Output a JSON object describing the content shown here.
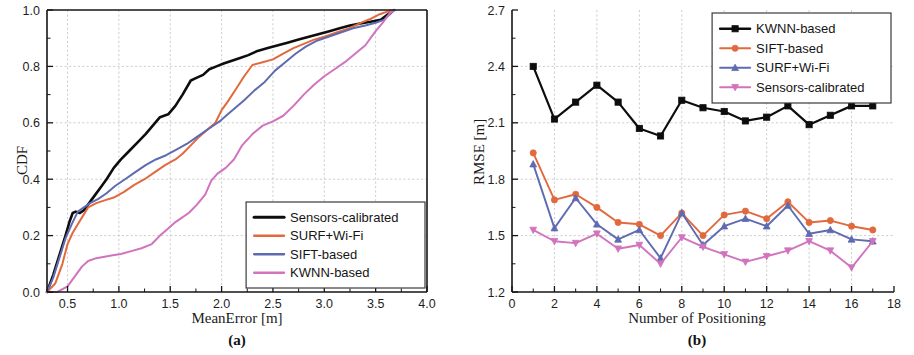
{
  "figure": {
    "panel_a_caption": "(a)",
    "panel_b_caption": "(b)"
  },
  "colors": {
    "sensors_calibrated": "#0d0d0d",
    "surf_wifi": "#e2693d",
    "sift_based": "#5f6bb0",
    "kwnn_based": "#d173bd",
    "grid": "#b9b9b9",
    "axis": "#151515"
  },
  "chart_data": [
    {
      "id": "panel-a",
      "type": "line",
      "title": "",
      "xlabel": "MeanError [m]",
      "ylabel": "CDF",
      "xlim": [
        0.3,
        4.0
      ],
      "ylim": [
        0.0,
        1.0
      ],
      "grid": true,
      "legend_position": "bottom-right",
      "xticks": [
        "0.5",
        "1.0",
        "1.5",
        "2.0",
        "2.5",
        "3.0",
        "3.5",
        "4.0"
      ],
      "xtick_values": [
        0.5,
        1.0,
        1.5,
        2.0,
        2.5,
        3.0,
        3.5,
        4.0
      ],
      "yticks": [
        "0.0",
        "0.2",
        "0.4",
        "0.6",
        "0.8",
        "1.0"
      ],
      "ytick_values": [
        0.0,
        0.2,
        0.4,
        0.6,
        0.8,
        1.0
      ],
      "series": [
        {
          "name": "Sensors-calibrated",
          "color": "#0d0d0d",
          "x": [
            0.3,
            0.36,
            0.42,
            0.48,
            0.52,
            0.55,
            0.58,
            0.62,
            0.66,
            0.7,
            0.76,
            0.82,
            0.88,
            0.95,
            1.02,
            1.1,
            1.18,
            1.26,
            1.33,
            1.4,
            1.48,
            1.55,
            1.62,
            1.7,
            1.76,
            1.82,
            1.88,
            1.95,
            2.02,
            2.1,
            2.18,
            2.26,
            2.35,
            2.45,
            2.55,
            2.65,
            2.75,
            2.85,
            2.95,
            3.05,
            3.15,
            3.25,
            3.35,
            3.45,
            3.55,
            3.62,
            3.68
          ],
          "y": [
            0.0,
            0.06,
            0.13,
            0.2,
            0.25,
            0.28,
            0.285,
            0.28,
            0.29,
            0.31,
            0.34,
            0.37,
            0.4,
            0.44,
            0.47,
            0.5,
            0.53,
            0.56,
            0.59,
            0.62,
            0.63,
            0.66,
            0.7,
            0.75,
            0.76,
            0.77,
            0.79,
            0.8,
            0.81,
            0.82,
            0.83,
            0.84,
            0.855,
            0.865,
            0.875,
            0.885,
            0.895,
            0.905,
            0.915,
            0.925,
            0.935,
            0.945,
            0.952,
            0.958,
            0.965,
            0.985,
            1.0
          ]
        },
        {
          "name": "SURF+Wi-Fi",
          "color": "#e2693d",
          "x": [
            0.3,
            0.38,
            0.45,
            0.5,
            0.55,
            0.6,
            0.65,
            0.7,
            0.78,
            0.86,
            0.95,
            1.05,
            1.15,
            1.25,
            1.35,
            1.45,
            1.55,
            1.62,
            1.7,
            1.78,
            1.86,
            1.94,
            2.0,
            2.06,
            2.14,
            2.22,
            2.3,
            2.4,
            2.5,
            2.6,
            2.7,
            2.8,
            2.9,
            3.0,
            3.12,
            3.24,
            3.36,
            3.46,
            3.54,
            3.62,
            3.68
          ],
          "y": [
            0.0,
            0.03,
            0.1,
            0.17,
            0.21,
            0.24,
            0.27,
            0.3,
            0.315,
            0.325,
            0.335,
            0.355,
            0.38,
            0.4,
            0.425,
            0.45,
            0.47,
            0.49,
            0.52,
            0.55,
            0.575,
            0.6,
            0.645,
            0.675,
            0.72,
            0.765,
            0.805,
            0.815,
            0.825,
            0.845,
            0.865,
            0.88,
            0.895,
            0.905,
            0.92,
            0.935,
            0.955,
            0.97,
            0.985,
            0.995,
            1.0
          ]
        },
        {
          "name": "SIFT-based",
          "color": "#5f6bb0",
          "x": [
            0.3,
            0.36,
            0.42,
            0.48,
            0.54,
            0.6,
            0.66,
            0.72,
            0.8,
            0.88,
            0.96,
            1.06,
            1.16,
            1.26,
            1.36,
            1.46,
            1.56,
            1.66,
            1.74,
            1.82,
            1.9,
            1.98,
            2.06,
            2.14,
            2.22,
            2.32,
            2.42,
            2.52,
            2.62,
            2.72,
            2.82,
            2.92,
            3.04,
            3.16,
            3.28,
            3.4,
            3.5,
            3.58,
            3.64,
            3.68
          ],
          "y": [
            0.0,
            0.05,
            0.12,
            0.19,
            0.24,
            0.285,
            0.3,
            0.315,
            0.33,
            0.35,
            0.375,
            0.4,
            0.425,
            0.45,
            0.47,
            0.485,
            0.505,
            0.525,
            0.545,
            0.565,
            0.585,
            0.605,
            0.63,
            0.655,
            0.68,
            0.715,
            0.745,
            0.785,
            0.815,
            0.845,
            0.87,
            0.89,
            0.905,
            0.92,
            0.935,
            0.945,
            0.955,
            0.965,
            0.985,
            1.0
          ]
        },
        {
          "name": "KWNN-based",
          "color": "#d173bd",
          "x": [
            0.3,
            0.4,
            0.5,
            0.58,
            0.64,
            0.7,
            0.78,
            0.86,
            0.94,
            1.02,
            1.12,
            1.22,
            1.32,
            1.4,
            1.48,
            1.54,
            1.6,
            1.68,
            1.76,
            1.84,
            1.9,
            1.96,
            2.04,
            2.12,
            2.2,
            2.3,
            2.4,
            2.5,
            2.6,
            2.7,
            2.8,
            2.9,
            3.0,
            3.1,
            3.2,
            3.3,
            3.4,
            3.5,
            3.58,
            3.64,
            3.68
          ],
          "y": [
            0.0,
            0.0,
            0.02,
            0.06,
            0.09,
            0.11,
            0.12,
            0.125,
            0.13,
            0.135,
            0.145,
            0.155,
            0.17,
            0.2,
            0.225,
            0.245,
            0.26,
            0.28,
            0.31,
            0.345,
            0.395,
            0.42,
            0.44,
            0.47,
            0.52,
            0.56,
            0.59,
            0.605,
            0.625,
            0.66,
            0.7,
            0.735,
            0.765,
            0.79,
            0.815,
            0.845,
            0.875,
            0.925,
            0.96,
            0.99,
            1.0
          ]
        }
      ],
      "legend": [
        "Sensors-calibrated",
        "SURF+Wi-Fi",
        "SIFT-based",
        "KWNN-based"
      ]
    },
    {
      "id": "panel-b",
      "type": "line",
      "title": "",
      "xlabel": "Number of Positioning",
      "ylabel": "RMSE [m]",
      "xlim": [
        0,
        18
      ],
      "ylim": [
        1.2,
        2.7
      ],
      "grid": true,
      "legend_position": "top-right",
      "xticks": [
        "0",
        "2",
        "4",
        "6",
        "8",
        "10",
        "12",
        "14",
        "16",
        "18"
      ],
      "xtick_values": [
        0,
        2,
        4,
        6,
        8,
        10,
        12,
        14,
        16,
        18
      ],
      "yticks": [
        "1.2",
        "1.5",
        "1.8",
        "2.1",
        "2.4",
        "2.7"
      ],
      "ytick_values": [
        1.2,
        1.5,
        1.8,
        2.1,
        2.4,
        2.7
      ],
      "categories": [
        1,
        2,
        3,
        4,
        5,
        6,
        7,
        8,
        9,
        10,
        11,
        12,
        13,
        14,
        15,
        16,
        17
      ],
      "series": [
        {
          "name": "KWNN-based",
          "color": "#0d0d0d",
          "marker": "square",
          "values": [
            2.4,
            2.12,
            2.21,
            2.3,
            2.21,
            2.07,
            2.03,
            2.22,
            2.18,
            2.16,
            2.11,
            2.13,
            2.19,
            2.09,
            2.14,
            2.19,
            2.19
          ]
        },
        {
          "name": "SIFT-based",
          "color": "#e2693d",
          "marker": "circle",
          "values": [
            1.94,
            1.69,
            1.72,
            1.65,
            1.57,
            1.56,
            1.5,
            1.62,
            1.5,
            1.61,
            1.63,
            1.59,
            1.68,
            1.57,
            1.58,
            1.55,
            1.53
          ]
        },
        {
          "name": "SURF+Wi-Fi",
          "color": "#5f6bb0",
          "marker": "triangle",
          "values": [
            1.88,
            1.54,
            1.7,
            1.56,
            1.48,
            1.53,
            1.38,
            1.62,
            1.45,
            1.55,
            1.59,
            1.55,
            1.66,
            1.51,
            1.53,
            1.48,
            1.47
          ]
        },
        {
          "name": "Sensors-calibrated",
          "color": "#d173bd",
          "marker": "triangle-down",
          "values": [
            1.53,
            1.47,
            1.46,
            1.51,
            1.43,
            1.45,
            1.35,
            1.49,
            1.44,
            1.4,
            1.36,
            1.39,
            1.42,
            1.47,
            1.42,
            1.33,
            1.47
          ]
        }
      ],
      "legend": [
        "KWNN-based",
        "SIFT-based",
        "SURF+Wi-Fi",
        "Sensors-calibrated"
      ]
    }
  ]
}
